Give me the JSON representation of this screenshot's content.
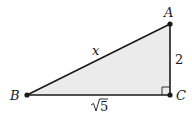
{
  "diagram": {
    "type": "right-triangle",
    "fill_color": "#ebebeb",
    "stroke_color": "#1a1a1a",
    "vertices": {
      "A": {
        "label": "A",
        "x": 170,
        "y": 24
      },
      "B": {
        "label": "B",
        "x": 27,
        "y": 95
      },
      "C": {
        "label": "C",
        "x": 170,
        "y": 95
      }
    },
    "right_angle_at": "C",
    "sides": {
      "AB": {
        "label": "x"
      },
      "AC": {
        "label": "2"
      },
      "BC": {
        "label_radicand": "5",
        "label": "√5"
      }
    }
  }
}
